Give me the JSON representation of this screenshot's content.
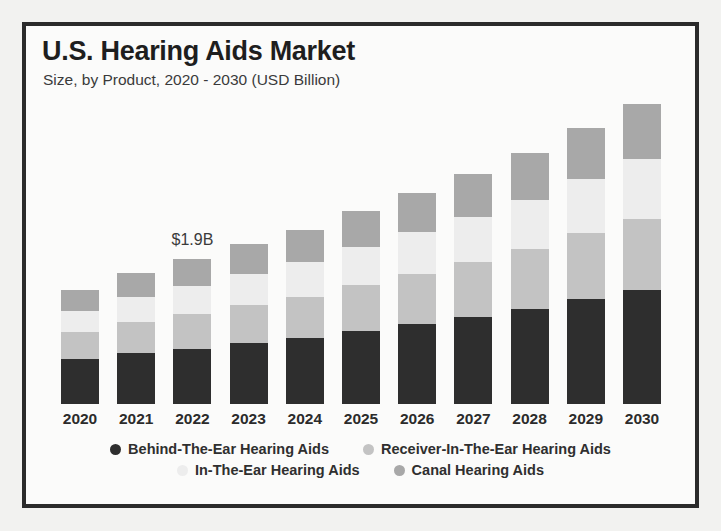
{
  "chart_data": {
    "type": "bar",
    "stacked": true,
    "title": "U.S. Hearing Aids Market",
    "subtitle": "Size, by Product, 2020 - 2030 (USD Billion)",
    "xlabel": "",
    "ylabel": "",
    "units": "USD Billion",
    "grid": false,
    "legend_position": "bottom",
    "categories": [
      "2020",
      "2021",
      "2022",
      "2023",
      "2024",
      "2025",
      "2026",
      "2027",
      "2028",
      "2029",
      "2030"
    ],
    "series": [
      {
        "name": "Behind-The-Ear Hearing Aids",
        "color": "#2e2e2e",
        "values": [
          0.62,
          0.7,
          0.76,
          0.83,
          0.9,
          1.0,
          1.09,
          1.19,
          1.3,
          1.44,
          1.56
        ]
      },
      {
        "name": "Receiver-In-The-Ear Hearing Aids",
        "color": "#c3c3c3",
        "values": [
          0.36,
          0.42,
          0.47,
          0.52,
          0.57,
          0.63,
          0.69,
          0.75,
          0.82,
          0.9,
          0.98
        ]
      },
      {
        "name": "In-The-Ear Hearing Aids",
        "color": "#ededed",
        "values": [
          0.3,
          0.35,
          0.39,
          0.43,
          0.47,
          0.52,
          0.57,
          0.62,
          0.68,
          0.74,
          0.81
        ]
      },
      {
        "name": "Canal Hearing Aids",
        "color": "#a8a8a8",
        "values": [
          0.28,
          0.33,
          0.37,
          0.41,
          0.45,
          0.49,
          0.54,
          0.59,
          0.64,
          0.7,
          0.76
        ]
      }
    ],
    "totals": [
      1.56,
      1.8,
      1.99,
      2.19,
      2.39,
      2.64,
      2.89,
      3.15,
      3.44,
      3.78,
      4.11
    ],
    "annotations": [
      {
        "text": "$1.9B",
        "category": "2022"
      }
    ]
  },
  "legend": {
    "rows": [
      [
        {
          "label": "Behind-The-Ear Hearing Aids",
          "color": "#2e2e2e"
        },
        {
          "label": "Receiver-In-The-Ear Hearing Aids",
          "color": "#c3c3c3"
        }
      ],
      [
        {
          "label": "In-The-Ear Hearing Aids",
          "color": "#ededed"
        },
        {
          "label": "Canal Hearing Aids",
          "color": "#a8a8a8"
        }
      ]
    ]
  }
}
